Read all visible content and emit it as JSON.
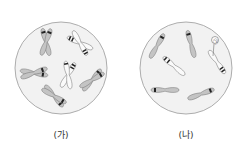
{
  "panels": [
    {
      "label": "(가)",
      "description": "cell with 6 duplicated X-shaped chromosomes"
    },
    {
      "label": "(나)",
      "description": "cell with 6 single-chromatid chromosomes"
    }
  ],
  "annotation": {
    "label": "㉠"
  },
  "colors": {
    "cell_fill": "#f2f2f2",
    "cell_stroke": "#999999",
    "chromosome_fill": "#bdbdbd",
    "band": "#222222"
  }
}
